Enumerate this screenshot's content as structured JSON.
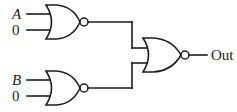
{
  "diagram": {
    "kind": "logic-circuit",
    "colors": {
      "line": "#1d1d1d",
      "background": "#ffffff",
      "bubble_fill": "#ffffff"
    },
    "gates": [
      {
        "id": "gate-top",
        "type": "NOR",
        "label": "NOR",
        "inputs": [
          "A",
          "0"
        ],
        "position": "top-left"
      },
      {
        "id": "gate-bottom",
        "type": "NOR",
        "label": "NOR",
        "inputs": [
          "B",
          "0"
        ],
        "position": "bottom-left"
      },
      {
        "id": "gate-output",
        "type": "NOR",
        "label": "NOR",
        "inputs": [
          "gate-top",
          "gate-bottom"
        ],
        "position": "right"
      }
    ],
    "labels": {
      "input_a": "A",
      "input_a_const": "0",
      "input_b": "B",
      "input_b_const": "0",
      "output": "Out"
    }
  }
}
